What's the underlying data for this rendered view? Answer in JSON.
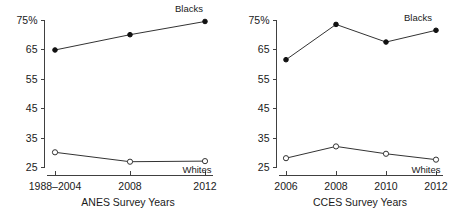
{
  "figure": {
    "background": "#ffffff",
    "line_color": "#333333",
    "axis_color": "#404040",
    "text_color": "#1a1a1a"
  },
  "chart_data": [
    {
      "type": "line",
      "title": "",
      "xlabel": "ANES Survey Years",
      "ylabel": "",
      "categories": [
        "1988–2004",
        "2008",
        "2012"
      ],
      "ytick_labels": [
        "25",
        "35",
        "45",
        "55",
        "65",
        "75%"
      ],
      "yticks": [
        25,
        35,
        45,
        55,
        65,
        75
      ],
      "ylim": [
        25,
        75
      ],
      "grid": false,
      "legend": "inline-labels",
      "series": [
        {
          "name": "Blacks",
          "marker": "filled-circle",
          "values": [
            64.8,
            70.0,
            74.5
          ]
        },
        {
          "name": "Whites",
          "marker": "open-circle",
          "values": [
            30.0,
            26.8,
            27.0
          ]
        }
      ]
    },
    {
      "type": "line",
      "title": "",
      "xlabel": "CCES Survey Years",
      "ylabel": "",
      "categories": [
        "2006",
        "2008",
        "2010",
        "2012"
      ],
      "ytick_labels": [
        "25",
        "35",
        "45",
        "55",
        "65",
        "75%"
      ],
      "yticks": [
        25,
        35,
        45,
        55,
        65,
        75
      ],
      "ylim": [
        25,
        75
      ],
      "grid": false,
      "legend": "inline-labels",
      "series": [
        {
          "name": "Blacks",
          "marker": "filled-circle",
          "values": [
            61.5,
            73.5,
            67.5,
            71.5
          ]
        },
        {
          "name": "Whites",
          "marker": "open-circle",
          "values": [
            28.0,
            32.0,
            29.5,
            27.5
          ]
        }
      ]
    }
  ]
}
